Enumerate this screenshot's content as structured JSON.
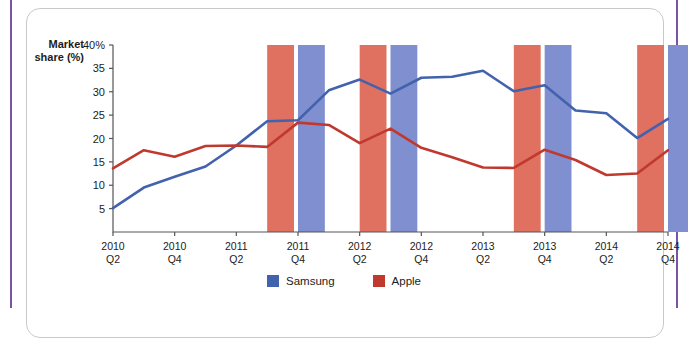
{
  "chart_data": {
    "type": "line",
    "title": "",
    "xlabel": "",
    "ylabel": "Market share (%)",
    "ylim": [
      0,
      40
    ],
    "ytick_labels": [
      "40%",
      "35",
      "30",
      "25",
      "20",
      "15",
      "10",
      "5"
    ],
    "ytick_values": [
      40,
      35,
      30,
      25,
      20,
      15,
      10,
      5
    ],
    "grid": false,
    "legend_position": "bottom-center",
    "x": [
      "2010 Q2",
      "2010 Q3",
      "2010 Q4",
      "2011 Q1",
      "2011 Q2",
      "2011 Q3",
      "2011 Q4",
      "2012 Q1",
      "2012 Q2",
      "2012 Q3",
      "2012 Q4",
      "2013 Q1",
      "2013 Q2",
      "2013 Q3",
      "2013 Q4",
      "2014 Q1",
      "2014 Q2",
      "2014 Q3",
      "2014 Q4"
    ],
    "xtick_labels": [
      {
        "year": "2010",
        "quarter": "Q2"
      },
      {
        "year": "2010",
        "quarter": "Q4"
      },
      {
        "year": "2011",
        "quarter": "Q2"
      },
      {
        "year": "2011",
        "quarter": "Q4"
      },
      {
        "year": "2012",
        "quarter": "Q2"
      },
      {
        "year": "2012",
        "quarter": "Q4"
      },
      {
        "year": "2013",
        "quarter": "Q2"
      },
      {
        "year": "2013",
        "quarter": "Q4"
      },
      {
        "year": "2014",
        "quarter": "Q2"
      },
      {
        "year": "2014",
        "quarter": "Q4"
      }
    ],
    "series": [
      {
        "name": "Samsung",
        "color": "#4262ad",
        "values": [
          5.1,
          9.5,
          11.8,
          14.0,
          18.5,
          23.7,
          23.9,
          30.3,
          32.6,
          29.6,
          33.0,
          33.2,
          34.5,
          30.1,
          31.4,
          26.0,
          25.4,
          20.1,
          24.2
        ]
      },
      {
        "name": "Apple",
        "color": "#c0392f",
        "values": [
          13.6,
          17.5,
          16.1,
          18.4,
          18.5,
          18.2,
          23.4,
          22.9,
          19.0,
          22.1,
          18.0,
          16.0,
          13.8,
          13.7,
          17.6,
          15.4,
          12.2,
          12.5,
          17.5
        ]
      }
    ],
    "highlight_bands": [
      {
        "series": "Apple",
        "color": "#e0705f",
        "x_start": "2011 Q3",
        "x_end": "2011 Q4"
      },
      {
        "series": "Samsung",
        "color": "#7f8fd0",
        "x_start": "2011 Q4",
        "x_end": "2012 Q1"
      },
      {
        "series": "Apple",
        "color": "#e0705f",
        "x_start": "2012 Q2",
        "x_end": "2012 Q3"
      },
      {
        "series": "Samsung",
        "color": "#7f8fd0",
        "x_start": "2012 Q3",
        "x_end": "2012 Q4"
      },
      {
        "series": "Apple",
        "color": "#e0705f",
        "x_start": "2013 Q3",
        "x_end": "2013 Q4"
      },
      {
        "series": "Samsung",
        "color": "#7f8fd0",
        "x_start": "2013 Q4",
        "x_end": "2014 Q1"
      },
      {
        "series": "Apple",
        "color": "#e0705f",
        "x_start": "2014 Q3",
        "x_end": "2014 Q4"
      },
      {
        "series": "Samsung",
        "color": "#7f8fd0",
        "x_start": "2014 Q4",
        "x_end": "2014 Q4"
      }
    ]
  },
  "legend": {
    "entries": [
      {
        "label": "Samsung",
        "color": "#4262ad"
      },
      {
        "label": "Apple",
        "color": "#c0392f"
      }
    ]
  },
  "axis": {
    "y_label_line1": "Market",
    "y_label_line2": "share (%)"
  },
  "colors": {
    "samsung_line": "#4262ad",
    "apple_line": "#c0392f",
    "samsung_band": "#7f8fd0",
    "apple_band": "#e0705f",
    "frame_rail": "#7a52a8",
    "panel_border": "#c9c9cc",
    "axis": "#555555",
    "text": "#1c1c1c"
  }
}
